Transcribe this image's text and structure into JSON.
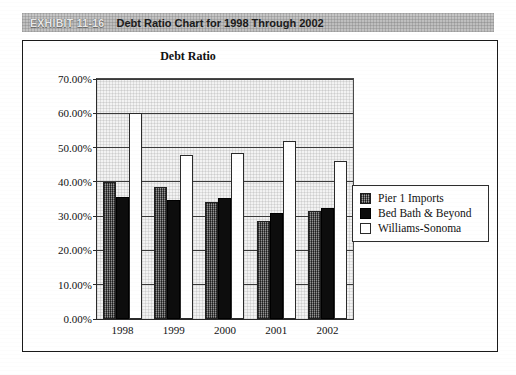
{
  "exhibit": {
    "number": "EXHIBIT 11-16",
    "title": "Debt Ratio Chart for 1998 Through 2002"
  },
  "chart_data": {
    "type": "bar",
    "title": "Debt Ratio",
    "xlabel": "",
    "ylabel": "",
    "categories": [
      "1998",
      "1999",
      "2000",
      "2001",
      "2002"
    ],
    "series": [
      {
        "name": "Pier 1 Imports",
        "values": [
          40.0,
          38.5,
          34.2,
          28.7,
          31.4
        ],
        "color": "#4a4a4a"
      },
      {
        "name": "Bed Bath & Beyond",
        "values": [
          35.7,
          34.7,
          35.2,
          30.8,
          32.3
        ],
        "color": "#0d0d0d"
      },
      {
        "name": "Williams-Sonoma",
        "values": [
          60.0,
          47.8,
          48.5,
          52.0,
          46.2
        ],
        "color": "#ffffff"
      }
    ],
    "ylim": [
      0,
      70
    ],
    "ytick_values": [
      0,
      10,
      20,
      30,
      40,
      50,
      60,
      70
    ],
    "ytick_labels": [
      "0.00%",
      "10.00%",
      "20.00%",
      "30.00%",
      "40.00%",
      "50.00%",
      "60.00%",
      "70.00%"
    ],
    "grid": true,
    "legend_position": "right"
  },
  "legend": {
    "items": [
      {
        "label": "Pier 1 Imports",
        "swatch": "series-pier"
      },
      {
        "label": "Bed Bath & Beyond",
        "swatch": "series-bbb"
      },
      {
        "label": "Williams-Sonoma",
        "swatch": "series-ws"
      }
    ]
  }
}
